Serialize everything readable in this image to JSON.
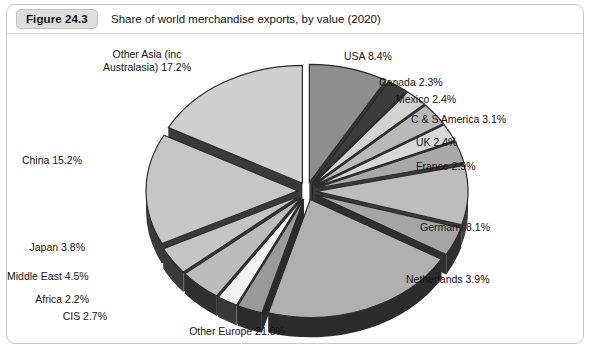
{
  "figure": {
    "badge": "Figure 24.3",
    "title": "Share of world merchandise exports, by value (2020)"
  },
  "chart_data": {
    "type": "pie",
    "title": "Share of world merchandise exports, by value (2020)",
    "xlabel": "",
    "ylabel": "",
    "units": "percent",
    "exploded": true,
    "three_d": true,
    "start_angle_deg": 0,
    "direction": "clockwise",
    "legend": "none",
    "labels_outside": true,
    "categories": [
      "USA",
      "Canada",
      "Mexico",
      "C & S America",
      "UK",
      "France",
      "Germany",
      "Netherlands",
      "Other Europe",
      "CIS",
      "Africa",
      "Middle East",
      "Japan",
      "China",
      "Other Asia (inc Australasia)"
    ],
    "values": [
      8.4,
      2.3,
      2.4,
      3.1,
      2.4,
      2.9,
      8.1,
      3.9,
      21.0,
      2.7,
      2.2,
      4.5,
      3.8,
      15.2,
      17.2
    ],
    "slices": [
      {
        "name": "USA",
        "value": 8.4,
        "label": "USA 8.4%",
        "color": "#8e8e8e",
        "side_color": "#3a3a3a",
        "label_pos": "right",
        "label_x": 337,
        "label_y": 16
      },
      {
        "name": "Canada",
        "value": 2.3,
        "label": "Canada 2.3%",
        "color": "#3c3c3c",
        "side_color": "#252525",
        "label_pos": "right",
        "label_x": 372,
        "label_y": 42
      },
      {
        "name": "Mexico",
        "value": 2.4,
        "label": "Mexico 2.4%",
        "color": "#d2d2d2",
        "side_color": "#3a3a3a",
        "label_pos": "right",
        "label_x": 389,
        "label_y": 59
      },
      {
        "name": "C & S America",
        "value": 3.1,
        "label": "C & S America 3.1%",
        "color": "#b9b9b9",
        "side_color": "#3a3a3a",
        "label_pos": "right",
        "label_x": 404,
        "label_y": 79
      },
      {
        "name": "UK",
        "value": 2.4,
        "label": "UK 2.4%",
        "color": "#d8d8d8",
        "side_color": "#3a3a3a",
        "label_pos": "right",
        "label_x": 409,
        "label_y": 102
      },
      {
        "name": "France",
        "value": 2.9,
        "label": "France 2.9%",
        "color": "#a8a8a8",
        "side_color": "#3a3a3a",
        "label_pos": "right",
        "label_x": 409,
        "label_y": 126
      },
      {
        "name": "Germany",
        "value": 8.1,
        "label": "Germany 8.1%",
        "color": "#bdbdbd",
        "side_color": "#3a3a3a",
        "label_pos": "right",
        "label_x": 413,
        "label_y": 187
      },
      {
        "name": "Netherlands",
        "value": 3.9,
        "label": "Netherlands 3.9%",
        "color": "#a5a5a5",
        "side_color": "#2f2f2f",
        "label_pos": "right",
        "label_x": 399,
        "label_y": 239
      },
      {
        "name": "Other Europe",
        "value": 21.0,
        "label": "Other Europe 21.0%",
        "color": "#b0b0b0",
        "side_color": "#2b2b2b",
        "label_pos": "center",
        "label_x": 205,
        "label_y": 291
      },
      {
        "name": "CIS",
        "value": 2.7,
        "label": "CIS 2.7%",
        "color": "#9a9a9a",
        "side_color": "#2b2b2b",
        "label_pos": "left",
        "label_x": 100,
        "label_y": 276
      },
      {
        "name": "Africa",
        "value": 2.2,
        "label": "Africa 2.2%",
        "color": "#f2f2f2",
        "side_color": "#3a3a3a",
        "label_pos": "left",
        "label_x": 82,
        "label_y": 259
      },
      {
        "name": "Middle East",
        "value": 4.5,
        "label": "Middle East 4.5%",
        "color": "#bcbcbc",
        "side_color": "#2f2f2f",
        "label_pos": "left",
        "label_x": 66,
        "label_y": 236
      },
      {
        "name": "Japan",
        "value": 3.8,
        "label": "Japan 3.8%",
        "color": "#c4c4c4",
        "side_color": "#3a3a3a",
        "label_pos": "left",
        "label_x": 78,
        "label_y": 207
      },
      {
        "name": "China",
        "value": 15.2,
        "label": "China 15.2%",
        "color": "#c6c6c6",
        "side_color": "#3a3a3a",
        "label_pos": "left",
        "label_x": 75,
        "label_y": 120
      },
      {
        "name": "Other Asia (inc Australasia)",
        "value": 17.2,
        "label": "Other Asia (inc\nAustralasia) 17.2%",
        "color": "#cfcfcf",
        "side_color": "#3a3a3a",
        "label_pos": "center",
        "label_x": 115,
        "label_y": 14
      }
    ],
    "geometry": {
      "cx": 300,
      "cy": 157,
      "rx": 152,
      "ry": 118,
      "depth": 20,
      "explode": 9
    }
  }
}
